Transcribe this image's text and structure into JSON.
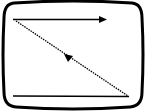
{
  "diagram": {
    "colors": {
      "stroke": "#000000",
      "background": "#ffffff"
    },
    "elements": [
      {
        "name": "screen-frame",
        "shape": "rounded-rectangle"
      },
      {
        "name": "scan-line-top",
        "style": "solid",
        "direction": "left-to-right",
        "arrow": "end"
      },
      {
        "name": "retrace-line",
        "style": "dotted",
        "direction": "bottom-right-to-top-left",
        "arrow": "middle"
      },
      {
        "name": "scan-line-bottom",
        "style": "solid",
        "arrow": "none"
      }
    ]
  }
}
